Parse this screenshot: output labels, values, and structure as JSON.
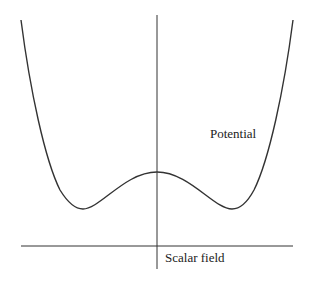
{
  "diagram": {
    "labels": {
      "potential": "Potential",
      "scalar_field": "Scalar field"
    },
    "colors": {
      "line": "#333333",
      "background": "#ffffff"
    }
  }
}
